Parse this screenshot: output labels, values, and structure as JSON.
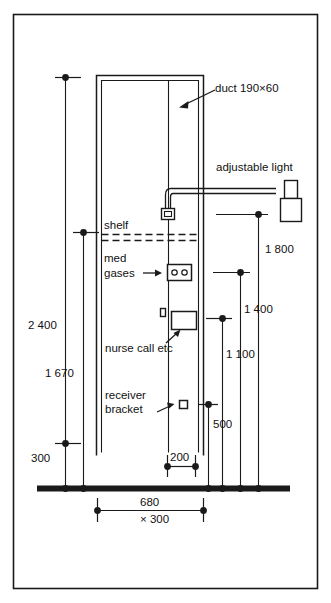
{
  "figure": {
    "background_color": "#ffffff",
    "line_color": "#1a1a1a",
    "border_color": "#1a1a1a",
    "width": 331,
    "height": 603
  },
  "annotations": {
    "duct": "duct 190×60",
    "adjustable_light": "adjustable light",
    "shelf": "shelf",
    "med_gases_line1": "med",
    "med_gases_line2": "gases",
    "nurse_call": "nurse call etc",
    "receiver_line1": "receiver",
    "receiver_line2": "bracket"
  },
  "dimensions": {
    "left": [
      {
        "label": "2 400",
        "x": 28,
        "y": 329
      },
      {
        "label": "1 670",
        "x": 45,
        "y": 377
      },
      {
        "label": "300",
        "x": 31,
        "y": 462
      }
    ],
    "right": [
      {
        "label": "1 800",
        "x": 265,
        "y": 253
      },
      {
        "label": "1 400",
        "x": 244,
        "y": 313
      },
      {
        "label": "1 100",
        "x": 226,
        "y": 358
      },
      {
        "label": "500",
        "x": 213,
        "y": 428
      }
    ],
    "bottom": [
      {
        "label": "200",
        "x": 170,
        "y": 460
      },
      {
        "label": "680",
        "x": 140,
        "y": 506
      },
      {
        "label": "× 300",
        "x": 140,
        "y": 520
      }
    ]
  },
  "components": {
    "duct_label": "duct",
    "light_label": "adjustable light",
    "shelf_label": "shelf",
    "gas_outlet_label": "med gases",
    "nurse_call_label": "nurse call etc",
    "receiver_bracket_label": "receiver bracket",
    "floor_label": "floor"
  }
}
